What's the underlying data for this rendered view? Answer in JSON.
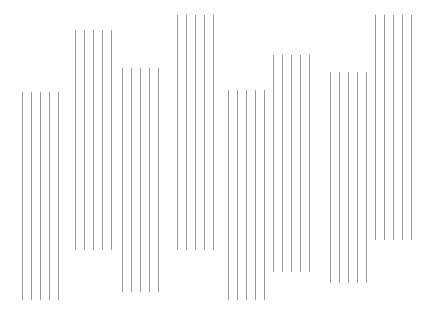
{
  "figure": {
    "title": "",
    "background_color": "#ffffff",
    "line_color": "#9a9a9e",
    "line_width_px": 1,
    "width_px": 439,
    "height_px": 317
  },
  "chart_data": {
    "type": "bar",
    "title": "",
    "xlabel": "",
    "ylabel": "",
    "grid": false,
    "legend": null,
    "axis_visible": false,
    "tick_labels": [],
    "categories": [
      "1",
      "2",
      "3",
      "4",
      "5",
      "6",
      "7",
      "8"
    ],
    "note": "Eight clusters of five thin vertical rules; each cluster spans a distinct vertical interval (top and bottom y in pixel coordinates measured from the top of the canvas).",
    "lines_per_group": 5,
    "line_spacing_px": 9,
    "ylim": [
      0,
      317
    ],
    "groups": [
      {
        "index": 1,
        "x_start": 22,
        "top": 92,
        "bottom": 300,
        "height": 208,
        "lines_x": [
          22,
          31,
          40,
          49,
          58
        ]
      },
      {
        "index": 2,
        "x_start": 75,
        "top": 30,
        "bottom": 250,
        "height": 220,
        "lines_x": [
          75,
          84,
          93,
          102,
          111
        ]
      },
      {
        "index": 3,
        "x_start": 122,
        "top": 68,
        "bottom": 292,
        "height": 224,
        "lines_x": [
          122,
          131,
          140,
          149,
          158
        ]
      },
      {
        "index": 4,
        "x_start": 177,
        "top": 15,
        "bottom": 250,
        "height": 235,
        "lines_x": [
          177,
          186,
          195,
          204,
          213
        ]
      },
      {
        "index": 5,
        "x_start": 228,
        "top": 90,
        "bottom": 300,
        "height": 210,
        "lines_x": [
          228,
          237,
          246,
          255,
          264
        ]
      },
      {
        "index": 6,
        "x_start": 273,
        "top": 55,
        "bottom": 272,
        "height": 217,
        "lines_x": [
          273,
          282,
          291,
          300,
          309
        ]
      },
      {
        "index": 7,
        "x_start": 330,
        "top": 72,
        "bottom": 283,
        "height": 211,
        "lines_x": [
          330,
          339,
          348,
          357,
          366
        ]
      },
      {
        "index": 8,
        "x_start": 375,
        "top": 15,
        "bottom": 240,
        "height": 225,
        "lines_x": [
          375,
          384,
          393,
          402,
          411
        ]
      }
    ],
    "values": [
      208,
      220,
      224,
      235,
      210,
      217,
      211,
      225
    ]
  }
}
